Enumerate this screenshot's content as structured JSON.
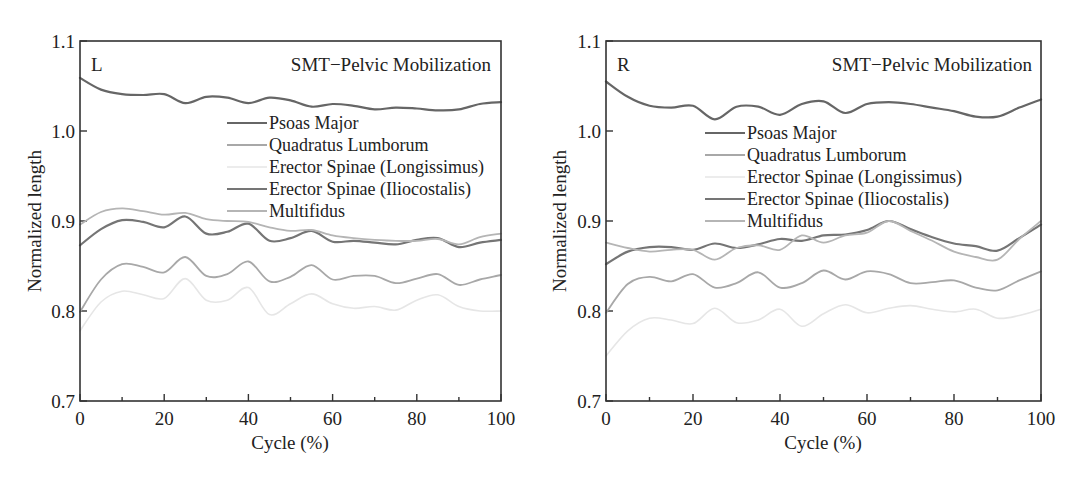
{
  "chart_data": [
    {
      "type": "line",
      "panel_label": "L",
      "title": "SMT−Pelvic Mobilization",
      "xlabel": "Cycle (%)",
      "ylabel": "Normalized length",
      "xlim": [
        0,
        100
      ],
      "ylim": [
        0.7,
        1.1
      ],
      "xticks": [
        0,
        20,
        40,
        60,
        80,
        100
      ],
      "xminor": [
        10,
        30,
        50,
        70,
        90
      ],
      "yticks": [
        0.7,
        0.8,
        0.9,
        1.0,
        1.1
      ],
      "ytick_labels": [
        "0.7",
        "0.8",
        "0.9",
        "1.0",
        "1.1"
      ],
      "grid": false,
      "legend_position": "center-right",
      "x": [
        0,
        5,
        10,
        15,
        20,
        25,
        30,
        35,
        40,
        45,
        50,
        55,
        60,
        65,
        70,
        75,
        80,
        85,
        90,
        95,
        100
      ],
      "series": [
        {
          "name": "Psoas Major",
          "color": "#666666",
          "values": [
            1.059,
            1.046,
            1.041,
            1.04,
            1.041,
            1.031,
            1.038,
            1.037,
            1.031,
            1.037,
            1.034,
            1.027,
            1.03,
            1.028,
            1.024,
            1.026,
            1.025,
            1.023,
            1.024,
            1.03,
            1.032
          ]
        },
        {
          "name": "Quadratus Lumborum",
          "color": "#a8a8a8",
          "values": [
            0.799,
            0.835,
            0.852,
            0.849,
            0.843,
            0.86,
            0.839,
            0.841,
            0.855,
            0.833,
            0.838,
            0.851,
            0.835,
            0.839,
            0.839,
            0.831,
            0.836,
            0.841,
            0.829,
            0.835,
            0.84
          ]
        },
        {
          "name": "Erector Spinae (Longissimus)",
          "color": "#e6e6e6",
          "values": [
            0.778,
            0.81,
            0.822,
            0.818,
            0.814,
            0.836,
            0.812,
            0.812,
            0.826,
            0.796,
            0.808,
            0.819,
            0.808,
            0.803,
            0.805,
            0.801,
            0.812,
            0.818,
            0.805,
            0.8,
            0.8
          ]
        },
        {
          "name": "Erector Spinae (Iliocostalis)",
          "color": "#757575",
          "values": [
            0.873,
            0.891,
            0.901,
            0.899,
            0.893,
            0.905,
            0.886,
            0.888,
            0.897,
            0.878,
            0.881,
            0.889,
            0.877,
            0.878,
            0.876,
            0.874,
            0.879,
            0.881,
            0.871,
            0.876,
            0.879
          ]
        },
        {
          "name": "Multifidus",
          "color": "#b5b5b5",
          "values": [
            0.896,
            0.91,
            0.914,
            0.911,
            0.907,
            0.909,
            0.902,
            0.9,
            0.899,
            0.893,
            0.889,
            0.89,
            0.884,
            0.881,
            0.879,
            0.878,
            0.878,
            0.88,
            0.874,
            0.882,
            0.886
          ]
        }
      ]
    },
    {
      "type": "line",
      "panel_label": "R",
      "title": "SMT−Pelvic Mobilization",
      "xlabel": "Cycle (%)",
      "ylabel": "Normalized length",
      "xlim": [
        0,
        100
      ],
      "ylim": [
        0.7,
        1.1
      ],
      "xticks": [
        0,
        20,
        40,
        60,
        80,
        100
      ],
      "xminor": [
        10,
        30,
        50,
        70,
        90
      ],
      "yticks": [
        0.7,
        0.8,
        0.9,
        1.0,
        1.1
      ],
      "ytick_labels": [
        "0.7",
        "0.8",
        "0.9",
        "1.0",
        "1.1"
      ],
      "grid": false,
      "legend_position": "center",
      "x": [
        0,
        5,
        10,
        15,
        20,
        25,
        30,
        35,
        40,
        45,
        50,
        55,
        60,
        65,
        70,
        75,
        80,
        85,
        90,
        95,
        100
      ],
      "series": [
        {
          "name": "Psoas Major",
          "color": "#666666",
          "values": [
            1.055,
            1.038,
            1.028,
            1.026,
            1.028,
            1.013,
            1.027,
            1.027,
            1.018,
            1.03,
            1.033,
            1.02,
            1.03,
            1.032,
            1.03,
            1.026,
            1.022,
            1.016,
            1.016,
            1.026,
            1.035
          ]
        },
        {
          "name": "Quadratus Lumborum",
          "color": "#a8a8a8",
          "values": [
            0.798,
            0.83,
            0.838,
            0.833,
            0.841,
            0.826,
            0.831,
            0.843,
            0.826,
            0.831,
            0.845,
            0.835,
            0.844,
            0.841,
            0.831,
            0.832,
            0.834,
            0.826,
            0.823,
            0.834,
            0.844
          ]
        },
        {
          "name": "Erector Spinae (Longissimus)",
          "color": "#e6e6e6",
          "values": [
            0.75,
            0.778,
            0.792,
            0.79,
            0.786,
            0.803,
            0.787,
            0.79,
            0.802,
            0.783,
            0.797,
            0.807,
            0.798,
            0.803,
            0.806,
            0.802,
            0.799,
            0.802,
            0.792,
            0.795,
            0.802
          ]
        },
        {
          "name": "Erector Spinae (Iliocostalis)",
          "color": "#757575",
          "values": [
            0.852,
            0.866,
            0.871,
            0.871,
            0.868,
            0.875,
            0.87,
            0.874,
            0.88,
            0.878,
            0.884,
            0.885,
            0.89,
            0.9,
            0.891,
            0.882,
            0.875,
            0.872,
            0.867,
            0.881,
            0.896
          ]
        },
        {
          "name": "Multifidus",
          "color": "#b5b5b5",
          "values": [
            0.876,
            0.87,
            0.866,
            0.868,
            0.868,
            0.857,
            0.87,
            0.873,
            0.868,
            0.884,
            0.876,
            0.884,
            0.887,
            0.9,
            0.889,
            0.878,
            0.866,
            0.86,
            0.857,
            0.88,
            0.9
          ]
        }
      ]
    }
  ]
}
